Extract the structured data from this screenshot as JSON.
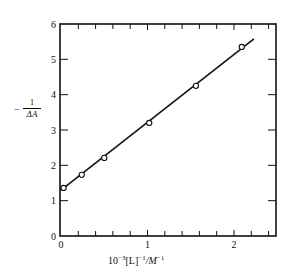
{
  "chart_data": {
    "type": "scatter",
    "title": "",
    "xlabel": "10^-3 [L]^-1 / M^-1",
    "ylabel": "-1/ΔA",
    "xlim": [
      0,
      2.4
    ],
    "ylim": [
      0,
      6
    ],
    "x_ticks": [
      0,
      1,
      2
    ],
    "x_tick_labels": [
      "0",
      "1",
      "2"
    ],
    "x_minor_tick_step": 0.2,
    "y_ticks": [
      0,
      1,
      2,
      3,
      4,
      5,
      6
    ],
    "y_tick_labels": [
      "0",
      "1",
      "2",
      "3",
      "4",
      "5",
      "6"
    ],
    "grid": false,
    "legend": null,
    "series": [
      {
        "name": "data",
        "marker": "open-circle",
        "x": [
          0.03,
          0.24,
          0.5,
          1.02,
          1.56,
          2.09
        ],
        "y": [
          1.36,
          1.73,
          2.21,
          3.2,
          4.25,
          5.35
        ]
      },
      {
        "name": "linear fit",
        "style": "line",
        "x": [
          0.0,
          2.23
        ],
        "y": [
          1.3,
          5.58
        ]
      }
    ]
  },
  "labels": {
    "ylabel_minus": "−",
    "ylabel_num": "1",
    "ylabel_den": "ΔA",
    "xlabel_base": "10",
    "xlabel_exp1": "−3",
    "xlabel_mid": "[L]",
    "xlabel_exp2": "−1",
    "xlabel_unit": "/M",
    "xlabel_exp3": "−1"
  }
}
